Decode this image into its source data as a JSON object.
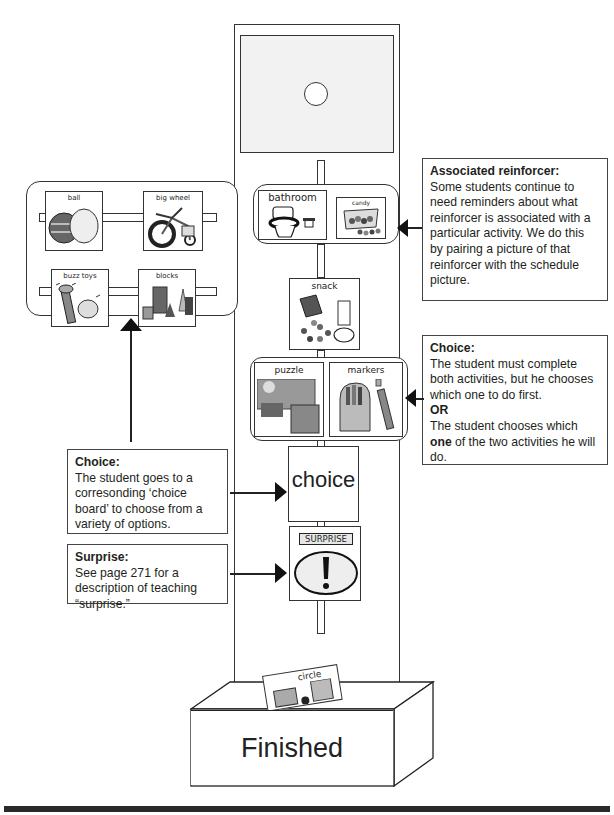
{
  "schedule": {
    "top_panel": {
      "icon": "circle-icon",
      "fill": "#f2f2f2"
    },
    "reinforcer_group": {
      "activity": {
        "label": "bathroom",
        "icon": "toilet-icon"
      },
      "reinforcer": {
        "label": "candy",
        "icon": "candy-bag-icon"
      }
    },
    "snack": {
      "label": "snack",
      "icon": "snack-food-icon"
    },
    "choice_pair": [
      {
        "label": "puzzle",
        "icon": "puzzle-icon"
      },
      {
        "label": "markers",
        "icon": "markers-icon"
      }
    ],
    "choice_card": {
      "label": "choice"
    },
    "surprise_card": {
      "label": "SURPRISE",
      "icon": "exclamation-icon"
    },
    "finished_box": {
      "label": "Finished",
      "card_in_box": {
        "label": "circle",
        "icon": "circle-time-icon"
      }
    }
  },
  "choice_board": {
    "items": [
      {
        "label": "ball",
        "icon": "ball-icon"
      },
      {
        "label": "big wheel",
        "icon": "tricycle-icon"
      },
      {
        "label": "buzz toys",
        "icon": "buzz-toys-icon"
      },
      {
        "label": "blocks",
        "icon": "blocks-icon"
      }
    ]
  },
  "callouts": {
    "associated_reinforcer": {
      "title": "Associated reinforcer:",
      "body": "Some students continue to need reminders about what reinforcer is associated with a particular activity.  We do this by pairing a picture of that reinforcer with the schedule picture."
    },
    "choice_right": {
      "title": "Choice:",
      "line1": "The student must complete both activities, but he chooses which one to do first.",
      "or": "OR",
      "line2_pre": "The student chooses which ",
      "line2_bold": "one",
      "line2_post": " of the two activities he will do."
    },
    "choice_left": {
      "title": "Choice:",
      "body": "The student goes to a corresonding ‘choice board’ to choose from a variety of options."
    },
    "surprise": {
      "title": "Surprise:",
      "body": "See page 271 for a description of teaching “surprise.”"
    }
  },
  "colors": {
    "line": "#333333",
    "panel_fill": "#f2f2f2",
    "footer_bar": "#2a2a2a"
  }
}
